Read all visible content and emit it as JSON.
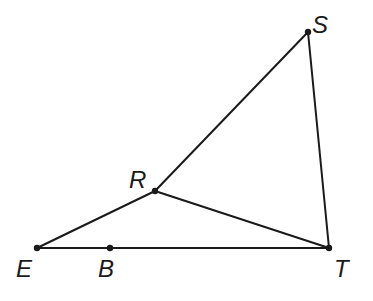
{
  "diagram": {
    "type": "geometry",
    "stroke_color": "#1a1a1a",
    "background": "#ffffff",
    "points": [
      {
        "id": "S",
        "label": "S",
        "x": 308,
        "y": 32,
        "lx": 312,
        "ly": 33
      },
      {
        "id": "R",
        "label": "R",
        "x": 155,
        "y": 191,
        "lx": 129,
        "ly": 188
      },
      {
        "id": "E",
        "label": "E",
        "x": 37,
        "y": 248,
        "lx": 16,
        "ly": 277
      },
      {
        "id": "B",
        "label": "B",
        "x": 110,
        "y": 248,
        "lx": 98,
        "ly": 277
      },
      {
        "id": "T",
        "label": "T",
        "x": 329,
        "y": 248,
        "lx": 334,
        "ly": 277
      }
    ],
    "segments": [
      {
        "from": "E",
        "to": "T"
      },
      {
        "from": "E",
        "to": "R"
      },
      {
        "from": "R",
        "to": "S"
      },
      {
        "from": "R",
        "to": "T"
      },
      {
        "from": "S",
        "to": "T"
      }
    ]
  }
}
